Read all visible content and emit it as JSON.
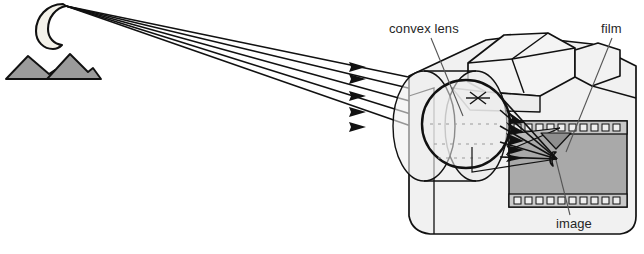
{
  "diagram": {
    "type": "optics-ray-diagram",
    "background_color": "#ffffff",
    "labels": {
      "convex_lens": "convex lens",
      "film": "film",
      "image": "image"
    },
    "colors": {
      "outline": "#111111",
      "camera_body": "#f0f0f0",
      "camera_body_shade": "#e2e2e2",
      "lens_barrel": "#e9e9e9",
      "lens_glass": "#efefef",
      "film_frame": "#a8a8a8",
      "film_strip": "#c9c9c9",
      "terrain_gray": "#9a9a9a",
      "moon_fill": "#f2f0e8",
      "ray": "#111111"
    },
    "scene": {
      "moon_label": "crescent-moon",
      "mountains_label": "mountain-range",
      "ray_count": 5
    },
    "film_detail": {
      "sprocket_holes_top": 11,
      "sprocket_holes_bottom": 11,
      "projected_image": "inverted crescent moon and mountains"
    }
  }
}
